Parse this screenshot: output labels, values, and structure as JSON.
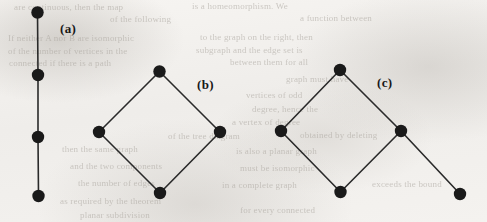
{
  "figure": {
    "caption_labels": [
      {
        "id": "a",
        "text": "(a)",
        "x": 60,
        "y": 21
      },
      {
        "id": "b",
        "text": "(b)",
        "x": 197,
        "y": 77
      },
      {
        "id": "c",
        "text": "(c)",
        "x": 377,
        "y": 75
      }
    ],
    "style": {
      "vertex_color": "#1a1a1a",
      "edge_color": "#2a2a2a",
      "vertex_radius": 6.2,
      "edge_width": 1.6,
      "background_color": "#f3f1ee"
    },
    "graphs": [
      {
        "id": "a",
        "label": "(a)",
        "name": "path-graph-p4",
        "vertex_count": 4,
        "edge_count": 3,
        "vertices": [
          {
            "id": "a1",
            "x": 37.5,
            "y": 12.5
          },
          {
            "id": "a2",
            "x": 38.0,
            "y": 75.0
          },
          {
            "id": "a3",
            "x": 38.0,
            "y": 137.0
          },
          {
            "id": "a4",
            "x": 38.5,
            "y": 196.0
          }
        ],
        "edges": [
          {
            "from": "a1",
            "to": "a2"
          },
          {
            "from": "a2",
            "to": "a3"
          },
          {
            "from": "a3",
            "to": "a4"
          }
        ]
      },
      {
        "id": "b",
        "label": "(b)",
        "name": "cycle-graph-c4",
        "vertex_count": 4,
        "edge_count": 4,
        "vertices": [
          {
            "id": "b_top",
            "x": 159.5,
            "y": 71.5
          },
          {
            "id": "b_left",
            "x": 99.0,
            "y": 132.0
          },
          {
            "id": "b_right",
            "x": 220.0,
            "y": 132.0
          },
          {
            "id": "b_bottom",
            "x": 160.0,
            "y": 193.0
          }
        ],
        "edges": [
          {
            "from": "b_top",
            "to": "b_left"
          },
          {
            "from": "b_top",
            "to": "b_right"
          },
          {
            "from": "b_left",
            "to": "b_bottom"
          },
          {
            "from": "b_right",
            "to": "b_bottom"
          }
        ]
      },
      {
        "id": "c",
        "label": "(c)",
        "name": "cycle-c4-with-pendant-vertex",
        "vertex_count": 5,
        "edge_count": 5,
        "vertices": [
          {
            "id": "c_top",
            "x": 340.0,
            "y": 70.0
          },
          {
            "id": "c_left",
            "x": 281.0,
            "y": 131.0
          },
          {
            "id": "c_right",
            "x": 401.0,
            "y": 131.0
          },
          {
            "id": "c_bottom",
            "x": 340.5,
            "y": 192.0
          },
          {
            "id": "c_pendant",
            "x": 460.0,
            "y": 194.0
          }
        ],
        "edges": [
          {
            "from": "c_top",
            "to": "c_left"
          },
          {
            "from": "c_top",
            "to": "c_right"
          },
          {
            "from": "c_left",
            "to": "c_bottom"
          },
          {
            "from": "c_right",
            "to": "c_bottom"
          },
          {
            "from": "c_right",
            "to": "c_pendant"
          }
        ]
      }
    ]
  },
  "background_bleed_text": [
    {
      "text": "are continuous, then the map",
      "x": 14,
      "y": 2,
      "size": 9,
      "rotate": 0
    },
    {
      "text": "is a homeomorphism. We",
      "x": 192,
      "y": 1,
      "size": 9,
      "rotate": 0
    },
    {
      "text": "of the following",
      "x": 110,
      "y": 14,
      "size": 9,
      "rotate": 0
    },
    {
      "text": "a function between",
      "x": 300,
      "y": 13,
      "size": 9,
      "rotate": 0
    },
    {
      "text": "If neither A nor B are isomorphic",
      "x": 8,
      "y": 33,
      "size": 9,
      "rotate": 0
    },
    {
      "text": "to the graph on the right, then",
      "x": 200,
      "y": 32,
      "size": 9,
      "rotate": 0
    },
    {
      "text": "of the number of vertices in the",
      "x": 8,
      "y": 46,
      "size": 9,
      "rotate": 0
    },
    {
      "text": "subgraph and the edge set is",
      "x": 196,
      "y": 45,
      "size": 9,
      "rotate": 0
    },
    {
      "text": "connected if there is a path",
      "x": 9,
      "y": 58,
      "size": 9,
      "rotate": 0
    },
    {
      "text": "between them for all",
      "x": 230,
      "y": 57,
      "size": 9,
      "rotate": 0
    },
    {
      "text": "graph must have",
      "x": 286,
      "y": 74,
      "size": 9,
      "rotate": 0
    },
    {
      "text": "vertices of odd",
      "x": 246,
      "y": 90,
      "size": 9,
      "rotate": 0
    },
    {
      "text": "degree, hence the",
      "x": 252,
      "y": 104,
      "size": 9,
      "rotate": 0
    },
    {
      "text": "a vertex of degree",
      "x": 232,
      "y": 117,
      "size": 9,
      "rotate": 0
    },
    {
      "text": "of the tree diagram",
      "x": 168,
      "y": 131,
      "size": 9,
      "rotate": 0
    },
    {
      "text": "obtained by deleting",
      "x": 300,
      "y": 130,
      "size": 9,
      "rotate": 0
    },
    {
      "text": "then the same graph",
      "x": 62,
      "y": 144,
      "size": 9,
      "rotate": 0
    },
    {
      "text": "is also a planar graph",
      "x": 236,
      "y": 146,
      "size": 9,
      "rotate": 0
    },
    {
      "text": "and the two components",
      "x": 70,
      "y": 161,
      "size": 9,
      "rotate": 0
    },
    {
      "text": "must be isomorphic",
      "x": 240,
      "y": 163,
      "size": 9,
      "rotate": 0
    },
    {
      "text": "the number of edges",
      "x": 78,
      "y": 178,
      "size": 9,
      "rotate": 0
    },
    {
      "text": "in a complete graph",
      "x": 222,
      "y": 180,
      "size": 9,
      "rotate": 0
    },
    {
      "text": "exceeds the bound",
      "x": 372,
      "y": 179,
      "size": 9,
      "rotate": 0
    },
    {
      "text": "as required by the theorem",
      "x": 60,
      "y": 196,
      "size": 9,
      "rotate": 0
    },
    {
      "text": "for every connected",
      "x": 240,
      "y": 205,
      "size": 9,
      "rotate": 0
    },
    {
      "text": "planar subdivision",
      "x": 80,
      "y": 210,
      "size": 9,
      "rotate": 0
    }
  ]
}
